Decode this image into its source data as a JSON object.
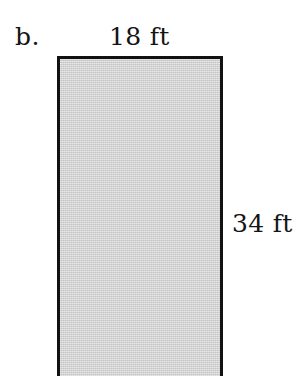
{
  "figure": {
    "part_label": "b.",
    "shape": "rectangle",
    "fill_color": "#d2d2d2",
    "stroke_color": "#121212",
    "background_color": "#ffffff",
    "labels": {
      "top": "18 ft",
      "right": "34 ft"
    },
    "dimensions": {
      "width_value": "18",
      "width_unit": "ft",
      "height_value": "34",
      "height_unit": "ft"
    }
  }
}
